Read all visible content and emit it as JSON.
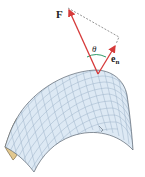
{
  "diagram": {
    "labels": {
      "force": "F",
      "normal_base": "e",
      "normal_sub": "n",
      "angle": "θ"
    },
    "colors": {
      "vector": "#d63a3a",
      "angle_arc": "#2f9a6a",
      "surface_fill": "#dde9f4",
      "surface_grid": "#9cb2c8",
      "surface_edge": "#5a6470",
      "underside_fill": "#e2c88f",
      "dashed": "#666666"
    },
    "elements": [
      {
        "id": "force-vector",
        "from": [
          98,
          74
        ],
        "to": [
          68,
          8
        ]
      },
      {
        "id": "normal-vector",
        "from": [
          98,
          74
        ],
        "to": [
          116,
          44
        ]
      },
      {
        "id": "projection-dashed",
        "points": [
          [
            68,
            8
          ],
          [
            119,
            37
          ],
          [
            116,
            44
          ]
        ]
      },
      {
        "id": "angle-arc",
        "between": [
          "force-vector",
          "normal-vector"
        ]
      },
      {
        "id": "curved-surface",
        "shape": "saddle-like dome mesh"
      }
    ]
  }
}
